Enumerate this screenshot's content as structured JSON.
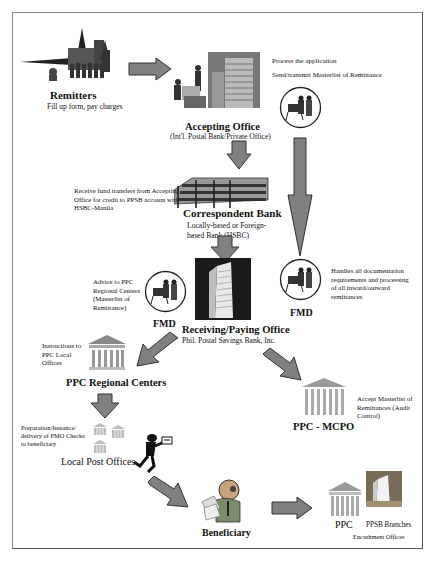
{
  "nodes": {
    "remitters": {
      "title": "Remitters",
      "subtitle": "Fill up form, pay charges"
    },
    "accepting_office": {
      "title": "Accepting Office",
      "subtitle": "(Int'l. Postal Bank/Private Office)",
      "note_1": "Process the application",
      "note_2": "Send/transmit Masterlist of Remittance"
    },
    "correspondent_bank": {
      "title": "Correspondent Bank",
      "subtitle_1": "Locally-based or Foreign-",
      "subtitle_2": "based Bank (HSBC)",
      "note": "Receive fund transfers from Accepting Office  for credit to PPSB account with HSBC-Manila"
    },
    "fmd_left": {
      "title": "FMD",
      "note": "Advice to PPC Regional Centers (Masterlist of Remittance)"
    },
    "fmd_right": {
      "title": "FMD",
      "note": "Handles all documentation requirements and processing of all inward/outward remittances"
    },
    "receiving_office": {
      "title": "Receiving/Paying Office",
      "subtitle": "Phil. Postal Savings Bank, Inc."
    },
    "ppc_regional": {
      "title": "PPC Regional Centers",
      "note": "Instructions to PPC Local Offices"
    },
    "ppc_mcpo": {
      "title": "PPC - MCPO",
      "note": "Accept Masterlist of Remittances (Audit Control)"
    },
    "local_post": {
      "title": "Local Post Offices",
      "note": "Preparation/Issuance/ delivery of PMO Checks to beneficiary"
    },
    "beneficiary": {
      "title": "Beneficiary"
    },
    "encashment": {
      "ppc_label": "PPC",
      "ppsb_label": "PPSB Branches",
      "caption": "Encashment Offices"
    }
  },
  "colors": {
    "arrow_fill": "#808080",
    "arrow_stroke": "#333333",
    "border": "#8a8a8a"
  }
}
